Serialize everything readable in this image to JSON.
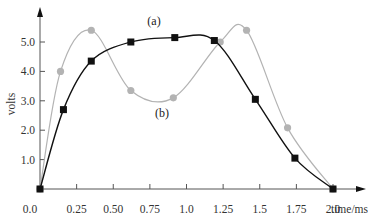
{
  "chart_data": {
    "type": "line",
    "title": "",
    "xlabel": "time/ms",
    "ylabel": "volts",
    "xlim": [
      0,
      2.0
    ],
    "ylim": [
      0,
      5.5
    ],
    "grid": false,
    "x_ticks": [
      "0.0",
      "0.25",
      "0.50",
      "0.75",
      "1.0",
      "1.25",
      "1.5",
      "1.75",
      "2.0"
    ],
    "y_ticks": [
      "1.0",
      "2.0",
      "3.0",
      "4.0",
      "5.0"
    ],
    "annotations": [
      "(a)",
      "(b)"
    ],
    "series": [
      {
        "name": "(a)",
        "marker": "square",
        "color": "#111111",
        "x": [
          0.0,
          0.16,
          0.35,
          0.62,
          0.92,
          1.19,
          1.47,
          1.74,
          2.0
        ],
        "y": [
          0.0,
          2.7,
          4.35,
          5.0,
          5.15,
          5.05,
          3.05,
          1.05,
          0.0
        ]
      },
      {
        "name": "(b)",
        "marker": "circle",
        "color": "#b3b3b3",
        "x": [
          0.0,
          0.14,
          0.35,
          0.62,
          0.91,
          1.23,
          1.41,
          1.69,
          2.0
        ],
        "y": [
          0.0,
          4.0,
          5.4,
          3.35,
          3.1,
          5.0,
          5.4,
          2.08,
          0.0
        ]
      }
    ]
  },
  "labels": {
    "x_axis_title": "time/ms",
    "y_axis_title": "volts",
    "series_a": "(a)",
    "series_b": "(b)"
  }
}
